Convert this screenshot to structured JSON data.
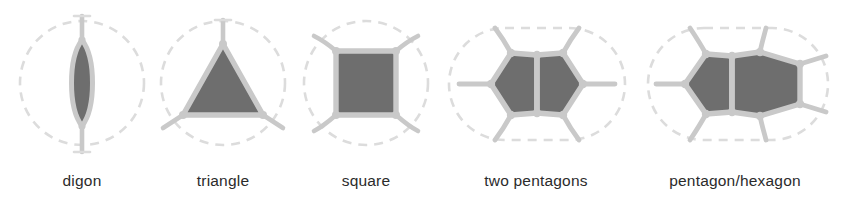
{
  "figure": {
    "width": 856,
    "height": 205,
    "background": "#ffffff",
    "colors": {
      "fill": "#6e6e6e",
      "stroke": "#c9c9c9",
      "dashed_boundary": "#dcdcdc",
      "caption_text": "#2b2b2b"
    }
  },
  "panels": [
    {
      "id": "digon",
      "label": "digon",
      "boundary_shape": "circle",
      "polygon_count": 1,
      "sides": 2,
      "radiating_edges": 2,
      "label_x": 81,
      "label_y": 180
    },
    {
      "id": "triangle",
      "label": "triangle",
      "boundary_shape": "circle",
      "polygon_count": 1,
      "sides": 3,
      "radiating_edges": 3,
      "label_x": 222,
      "label_y": 180
    },
    {
      "id": "square",
      "label": "square",
      "boundary_shape": "circle",
      "polygon_count": 1,
      "sides": 4,
      "radiating_edges": 4,
      "label_x": 366,
      "label_y": 180
    },
    {
      "id": "two-pentagons",
      "label": "two pentagons",
      "boundary_shape": "stadium",
      "polygon_count": 2,
      "sides": "5 + 5",
      "radiating_edges": 6,
      "label_x": 536,
      "label_y": 180
    },
    {
      "id": "pentagon-hexagon",
      "label": "pentagon/hexagon",
      "boundary_shape": "stadium",
      "polygon_count": 2,
      "sides": "5 + 6",
      "radiating_edges": 7,
      "label_x": 735,
      "label_y": 180
    }
  ]
}
